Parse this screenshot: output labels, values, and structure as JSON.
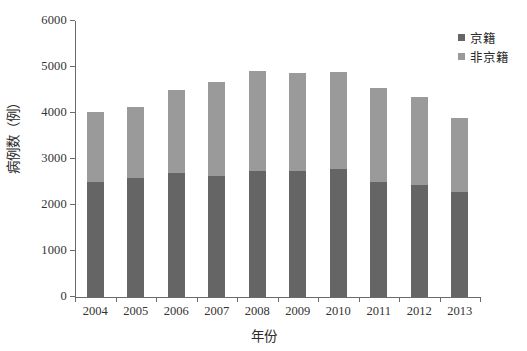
{
  "chart_data": {
    "type": "bar",
    "subtype": "stacked-column",
    "title": "",
    "xlabel": "年份",
    "ylabel": "病例数（例）",
    "categories": [
      "2004",
      "2005",
      "2006",
      "2007",
      "2008",
      "2009",
      "2010",
      "2011",
      "2012",
      "2013"
    ],
    "series": [
      {
        "name": "京籍",
        "color": "#656565",
        "values": [
          2510,
          2590,
          2700,
          2640,
          2750,
          2750,
          2780,
          2490,
          2440,
          2280
        ]
      },
      {
        "name": "非京籍",
        "color": "#9a9a9a",
        "values": [
          1510,
          1540,
          1790,
          2030,
          2170,
          2110,
          2120,
          2050,
          1900,
          1610
        ]
      }
    ],
    "totals": [
      4020,
      4130,
      4490,
      4670,
      4920,
      4860,
      4900,
      4540,
      4340,
      3890
    ],
    "ylim": [
      0,
      6000
    ],
    "yticks": [
      0,
      1000,
      2000,
      3000,
      4000,
      5000,
      6000
    ],
    "ytick_labels": [
      "0",
      "1000",
      "2000",
      "3000",
      "4000",
      "5000",
      "6000"
    ],
    "grid": false,
    "legend_position": "top-right"
  },
  "axes": {
    "x_title": "年份",
    "y_title": "病例数（例）"
  },
  "legend": {
    "entries": [
      {
        "label": "京籍",
        "color": "#656565"
      },
      {
        "label": "非京籍",
        "color": "#9a9a9a"
      }
    ]
  }
}
